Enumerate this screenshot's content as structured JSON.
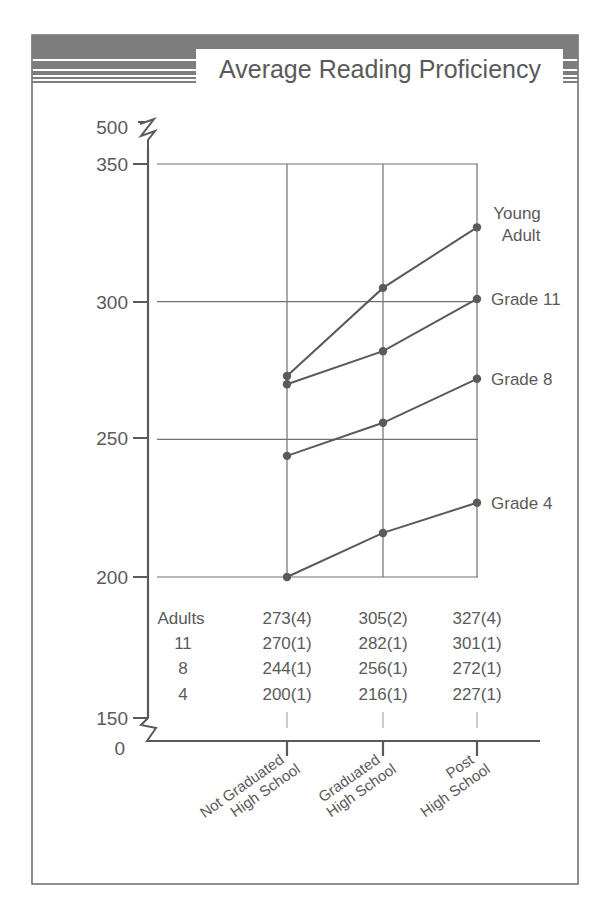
{
  "title": "Average Reading Proficiency",
  "colors": {
    "ink": "#5a5a5a",
    "header_bar": "#7d7d7d",
    "grid": "#707070",
    "background": "#ffffff"
  },
  "chart_data": {
    "type": "line",
    "title": "Average Reading Proficiency",
    "xlabel": "",
    "ylabel": "",
    "categories": [
      "Not Graduated High School",
      "Graduated High School",
      "Post High School"
    ],
    "category_lines": [
      [
        "Not Graduated",
        "High School"
      ],
      [
        "Graduated",
        "High School"
      ],
      [
        "Post",
        "High School"
      ]
    ],
    "yticks": [
      500,
      350,
      300,
      250,
      200,
      150,
      0
    ],
    "ylim": [
      200,
      350
    ],
    "axis_breaks": [
      "between 350 and 500",
      "between 0 and 150"
    ],
    "grid": true,
    "legend_position": "right (direct labels at line ends)",
    "series": [
      {
        "name": "Young Adult",
        "label_lines": [
          "Young",
          "Adult"
        ],
        "table_label": "Adults",
        "values": [
          273,
          305,
          327
        ],
        "std_err": [
          4,
          2,
          4
        ]
      },
      {
        "name": "Grade 11",
        "label_lines": [
          "Grade 11"
        ],
        "table_label": "11",
        "values": [
          270,
          282,
          301
        ],
        "std_err": [
          1,
          1,
          1
        ]
      },
      {
        "name": "Grade 8",
        "label_lines": [
          "Grade 8"
        ],
        "table_label": "8",
        "values": [
          244,
          256,
          272
        ],
        "std_err": [
          1,
          1,
          1
        ]
      },
      {
        "name": "Grade 4",
        "label_lines": [
          "Grade 4"
        ],
        "table_label": "4",
        "values": [
          200,
          216,
          227
        ],
        "std_err": [
          1,
          1,
          1
        ]
      }
    ],
    "table": {
      "row_labels": [
        "Adults",
        "11",
        "8",
        "4"
      ],
      "rows": [
        [
          "273(4)",
          "305(2)",
          "327(4)"
        ],
        [
          "270(1)",
          "282(1)",
          "301(1)"
        ],
        [
          "244(1)",
          "256(1)",
          "272(1)"
        ],
        [
          "200(1)",
          "216(1)",
          "227(1)"
        ]
      ]
    }
  }
}
